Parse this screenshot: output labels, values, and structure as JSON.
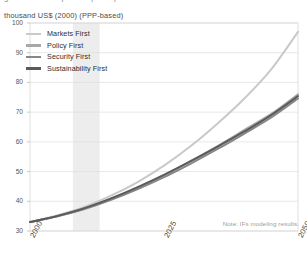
{
  "figure": {
    "top_clipped_text": "gross domestic product per capita",
    "unit_label": "thousand US$ (2000) (PPP-based)",
    "note": "Note: IFs modeling results."
  },
  "legend": {
    "position": "top-left-inside",
    "items": [
      {
        "label": "Markets First",
        "color": "#c9c9c9"
      },
      {
        "label": "Policy First",
        "color": "#a8a8a8"
      },
      {
        "label": "Security First",
        "color": "#868686"
      },
      {
        "label": "Sustainability First",
        "color": "#5a5a5a"
      }
    ]
  },
  "axes": {
    "y_ticks": [
      "100",
      "90",
      "80",
      "70",
      "60",
      "50",
      "40",
      "30"
    ],
    "x_ticks": [
      "2000",
      "2025",
      "2050"
    ]
  },
  "chart_data": {
    "type": "line",
    "title": "",
    "subtitle": "",
    "xlabel": "",
    "ylabel": "thousand US$ (2000) (PPP-based)",
    "xlim": [
      2000,
      2050
    ],
    "ylim": [
      30,
      100
    ],
    "ytick_values": [
      30,
      40,
      50,
      60,
      70,
      80,
      90,
      100
    ],
    "xtick_values": [
      2000,
      2025,
      2050
    ],
    "grid": "horizontal",
    "legend_position": "upper-left",
    "shaded_band": {
      "x_start": 2008,
      "x_end": 2013,
      "color": "#ededed"
    },
    "x": [
      2000,
      2005,
      2010,
      2015,
      2020,
      2025,
      2030,
      2035,
      2040,
      2045,
      2050
    ],
    "series": [
      {
        "name": "Markets First",
        "color": "#c9c9c9",
        "values": [
          33.0,
          35.2,
          38.0,
          41.8,
          46.4,
          52.0,
          58.6,
          66.2,
          74.6,
          84.4,
          97.0
        ]
      },
      {
        "name": "Policy First",
        "color": "#a8a8a8",
        "values": [
          33.0,
          35.0,
          37.5,
          40.8,
          44.6,
          48.8,
          53.6,
          58.6,
          64.0,
          69.4,
          76.0
        ]
      },
      {
        "name": "Security First",
        "color": "#868686",
        "values": [
          33.0,
          34.9,
          37.3,
          40.4,
          44.0,
          48.1,
          52.7,
          57.6,
          62.8,
          68.2,
          74.6
        ]
      },
      {
        "name": "Sustainability First",
        "color": "#5a5a5a",
        "values": [
          33.0,
          35.0,
          37.6,
          40.9,
          44.7,
          48.9,
          53.5,
          58.4,
          63.5,
          69.0,
          75.4
        ]
      }
    ]
  }
}
